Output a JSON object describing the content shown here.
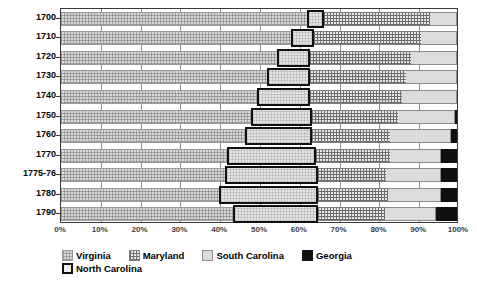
{
  "chart_data": {
    "type": "bar",
    "orientation": "horizontal",
    "stacked": true,
    "normalized_percent": true,
    "title": "",
    "subtitle": "",
    "xlabel": "",
    "ylabel": "",
    "xlim": [
      0,
      100
    ],
    "grid": true,
    "legend_position": "bottom",
    "categories": [
      "1700",
      "1710",
      "1720",
      "1730",
      "1740",
      "1750",
      "1760",
      "1770",
      "1775-76",
      "1780",
      "1790"
    ],
    "xticks": [
      "0%",
      "10%",
      "20%",
      "30%",
      "40%",
      "50%",
      "60%",
      "70%",
      "80%",
      "90%",
      "100%"
    ],
    "xtick_values": [
      0,
      10,
      20,
      30,
      40,
      50,
      60,
      70,
      80,
      90,
      100
    ],
    "series": [
      {
        "name": "Virginia",
        "key": "virginia",
        "pattern": "fine-crosshatch-light",
        "color": "#d8d8d8",
        "values": [
          62.0,
          58.0,
          54.5,
          52.0,
          49.5,
          48.0,
          46.5,
          42.0,
          41.5,
          40.0,
          43.5
        ]
      },
      {
        "name": "North Carolina",
        "key": "north_carolina",
        "pattern": "solid-bold-outline",
        "color": "#efefef",
        "values": [
          4.3,
          6.0,
          8.5,
          11.0,
          13.5,
          15.5,
          17.0,
          22.5,
          23.5,
          25.0,
          21.3
        ]
      },
      {
        "name": "Maryland",
        "key": "maryland",
        "pattern": "dense-grid",
        "color": "#e9e9e9",
        "values": [
          27.0,
          27.0,
          25.5,
          24.0,
          23.0,
          21.5,
          19.5,
          18.5,
          17.0,
          17.5,
          17.0
        ]
      },
      {
        "name": "South Carolina",
        "key": "south_carolina",
        "pattern": "plain-light-gray",
        "color": "#dcdcdc",
        "values": [
          6.7,
          9.0,
          11.5,
          13.0,
          14.0,
          14.5,
          15.5,
          13.0,
          14.0,
          13.5,
          13.0
        ]
      },
      {
        "name": "Georgia",
        "key": "georgia",
        "pattern": "solid-black",
        "color": "#101010",
        "values": [
          0.0,
          0.0,
          0.0,
          0.0,
          0.0,
          0.5,
          1.5,
          4.0,
          4.0,
          4.0,
          5.2
        ]
      }
    ]
  },
  "legend": {
    "entries": [
      {
        "label": "Virginia",
        "swatch": "va"
      },
      {
        "label": "Maryland",
        "swatch": "md"
      },
      {
        "label": "South Carolina",
        "swatch": "sc"
      },
      {
        "label": "Georgia",
        "swatch": "ga"
      },
      {
        "label": "North Carolina",
        "swatch": "nc"
      }
    ]
  }
}
